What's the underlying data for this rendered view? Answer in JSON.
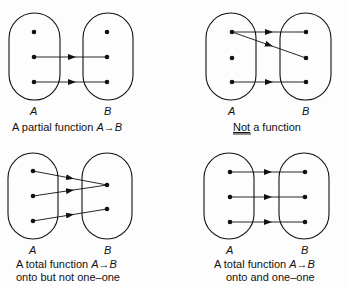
{
  "panels": [
    {
      "id": "partial",
      "caption_lines": [
        "A partial function A→B"
      ],
      "caption_underline": false,
      "set_a_label": "A",
      "set_b_label": "B",
      "mappings": [
        [
          1,
          1
        ],
        [
          2,
          2
        ]
      ]
    },
    {
      "id": "not-function",
      "caption_lines": [
        "Not a function"
      ],
      "caption_underline": "Not",
      "set_a_label": "A",
      "set_b_label": "B",
      "mappings": [
        [
          0,
          0
        ],
        [
          0,
          1
        ],
        [
          2,
          2
        ]
      ]
    },
    {
      "id": "total-onto-not-one-one",
      "caption_lines": [
        "A total function A→B",
        "onto but not one–one"
      ],
      "caption_underline": false,
      "set_a_label": "A",
      "set_b_label": "B",
      "a_count": 3,
      "b_count": 2,
      "mappings": [
        [
          0,
          0
        ],
        [
          1,
          0
        ],
        [
          2,
          1
        ]
      ]
    },
    {
      "id": "total-onto-one-one",
      "caption_lines": [
        "A total function A→B",
        "onto and one–one"
      ],
      "caption_underline": false,
      "set_a_label": "A",
      "set_b_label": "B",
      "mappings": [
        [
          0,
          0
        ],
        [
          1,
          1
        ],
        [
          2,
          2
        ]
      ]
    }
  ],
  "text": {
    "p1_cap": "A partial function ",
    "p2_cap_under": "Not",
    "p2_cap_rest": " a function",
    "p3_cap1": "A total function ",
    "p3_cap2": "onto but not one–one",
    "p4_cap1": "A total function ",
    "p4_cap2": "onto and one–one",
    "A": "A",
    "B": "B",
    "arrow": "→"
  }
}
